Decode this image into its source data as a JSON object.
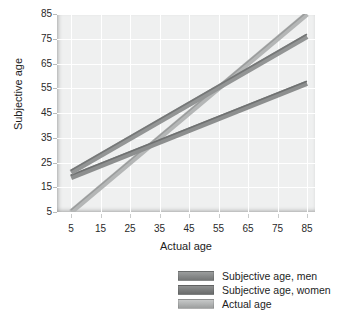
{
  "chart_data": {
    "type": "line",
    "title": "",
    "xlabel": "Actual age",
    "ylabel": "Subjective age",
    "xlim": [
      5,
      85
    ],
    "ylim": [
      5,
      85
    ],
    "xticks": [
      5,
      15,
      25,
      35,
      45,
      55,
      65,
      75,
      85
    ],
    "yticks": [
      5,
      15,
      25,
      35,
      45,
      55,
      65,
      75,
      85
    ],
    "grid": true,
    "legend_position": "bottom-right",
    "x": [
      5,
      85
    ],
    "series": [
      {
        "name": "Subjective age, men",
        "values": [
          21,
          76
        ],
        "color": "#8a8c8c",
        "x": [
          5,
          85
        ]
      },
      {
        "name": "Subjective age, women",
        "values": [
          19,
          57
        ],
        "color": "#8a8c8c",
        "x": [
          5,
          85
        ]
      },
      {
        "name": "Actual age",
        "values": [
          5,
          85
        ],
        "color": "#a8aaaa",
        "x": [
          5,
          85
        ]
      }
    ]
  },
  "axes": {
    "y": {
      "title": "Subjective age",
      "ticks": [
        "85",
        "75",
        "65",
        "55",
        "45",
        "35",
        "25",
        "15",
        "5"
      ]
    },
    "x": {
      "title": "Actual age",
      "ticks": [
        "5",
        "15",
        "25",
        "35",
        "45",
        "55",
        "65",
        "75",
        "85"
      ]
    }
  },
  "legend": {
    "items": [
      {
        "label": "Subjective age, men",
        "swatch": "#8a8c8c"
      },
      {
        "label": "Subjective age, women",
        "swatch": "#7e8080"
      },
      {
        "label": "Actual age",
        "swatch": "#b4b6b6"
      }
    ]
  },
  "colors": {
    "plot_background": "#eff0f0",
    "gridline": "#ffffff",
    "text": "#1d1d1d",
    "page_background": "#ffffff"
  }
}
